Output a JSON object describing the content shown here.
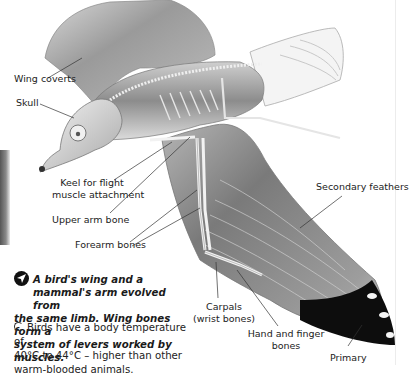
{
  "diagram": {
    "labels": {
      "wing_coverts": "Wing coverts",
      "skull": "Skull",
      "keel_line1": "Keel for flight",
      "keel_line2": "muscle attachment",
      "upper_arm": "Upper arm bone",
      "forearm": "Forearm bones",
      "secondary": "Secondary feathers",
      "carpals_line1": "Carpals",
      "carpals_line2": "(wrist bones)",
      "hand_line1": "Hand and finger",
      "hand_line2": "bones",
      "primary": "Primary"
    }
  },
  "fact_box": {
    "icon": "arrow-pointer-icon",
    "text": "A bird's wing and a mammal's arm evolved from the same limb. Wing bones form a system of levers worked by muscles.",
    "line1": "A bird's wing and a",
    "line2": "mammal's arm evolved from",
    "line3": "the same limb. Wing bones form a",
    "line4": "system of levers worked by muscles."
  },
  "note": {
    "bullet": "circle-bullet-icon",
    "line1": "Birds have a body temperature of",
    "line2": "40°C to 44°C – higher than other",
    "line3": "warm-blooded animals."
  },
  "colors": {
    "text": "#222222",
    "bone": "#f2f2f2",
    "wing_grey": "#8a8a8a",
    "primary_black": "#0d0d0d"
  }
}
